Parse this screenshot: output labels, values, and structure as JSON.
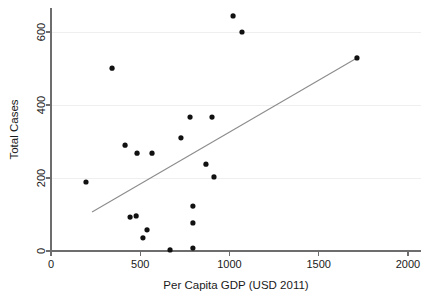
{
  "chart_data": {
    "type": "scatter",
    "title": "",
    "xlabel": "Per Capita GDP (USD 2011)",
    "ylabel": "Total Cases",
    "xlim": [
      0,
      2000
    ],
    "ylim": [
      -30,
      680
    ],
    "xticks": [
      0,
      500,
      1000,
      1500,
      2000
    ],
    "yticks": [
      0,
      200,
      400,
      600
    ],
    "xticklabels": [
      "0",
      "500",
      "1000",
      "1500",
      "2000"
    ],
    "yticklabels": [
      "0",
      "200",
      "400",
      "600"
    ],
    "grid": "horizontal",
    "legend": null,
    "series": [
      {
        "name": "Countries",
        "marker": "filled-circle",
        "color": "#111111",
        "points": [
          {
            "x": 196,
            "y": 189
          },
          {
            "x": 342,
            "y": 501
          },
          {
            "x": 415,
            "y": 290
          },
          {
            "x": 443,
            "y": 93
          },
          {
            "x": 477,
            "y": 96
          },
          {
            "x": 482,
            "y": 268
          },
          {
            "x": 515,
            "y": 36
          },
          {
            "x": 538,
            "y": 58
          },
          {
            "x": 566,
            "y": 268
          },
          {
            "x": 667,
            "y": 3
          },
          {
            "x": 728,
            "y": 310
          },
          {
            "x": 779,
            "y": 367
          },
          {
            "x": 795,
            "y": 123
          },
          {
            "x": 795,
            "y": 77
          },
          {
            "x": 795,
            "y": 8
          },
          {
            "x": 868,
            "y": 238
          },
          {
            "x": 902,
            "y": 367
          },
          {
            "x": 913,
            "y": 203
          },
          {
            "x": 1020,
            "y": 644
          },
          {
            "x": 1070,
            "y": 600
          },
          {
            "x": 1714,
            "y": 529
          }
        ]
      }
    ],
    "fit_line": {
      "name": "linear-fit",
      "color": "#8c8c8c",
      "x_start": 230,
      "y_start": 107,
      "x_end": 1714,
      "y_end": 529
    }
  }
}
